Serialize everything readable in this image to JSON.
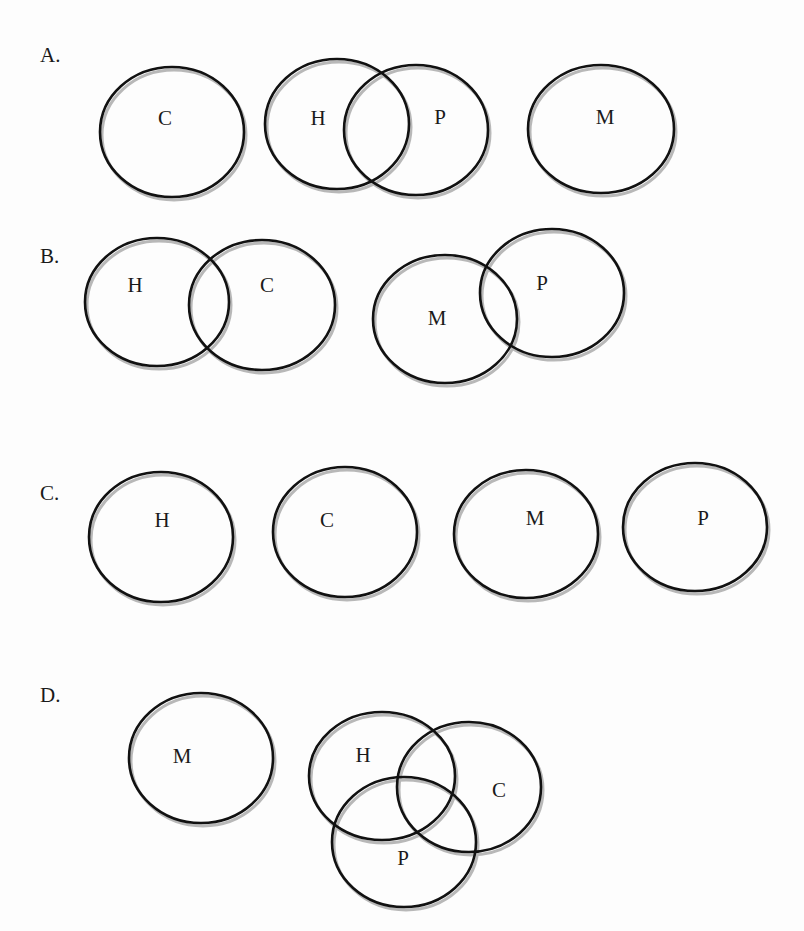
{
  "diagram": {
    "type": "set-relationship-options",
    "colors": {
      "stroke": "#111111",
      "shadow": "#b8b8b8",
      "text": "#1a1a1a",
      "background": "#fdfdfd"
    },
    "options": [
      {
        "label": "A.",
        "label_pos": [
          40,
          62
        ],
        "sets": [
          {
            "name": "C",
            "cx": 172,
            "cy": 132,
            "rx": 72,
            "ry": 65,
            "text_pos": [
              165,
              118
            ]
          },
          {
            "name": "H",
            "cx": 337,
            "cy": 124,
            "rx": 72,
            "ry": 65,
            "text_pos": [
              318,
              118
            ]
          },
          {
            "name": "P",
            "cx": 416,
            "cy": 130,
            "rx": 72,
            "ry": 65,
            "text_pos": [
              440,
              117
            ]
          },
          {
            "name": "M",
            "cx": 601,
            "cy": 129,
            "rx": 73,
            "ry": 64,
            "text_pos": [
              605,
              117
            ]
          }
        ],
        "overlaps": [
          [
            "H",
            "P"
          ]
        ]
      },
      {
        "label": "B.",
        "label_pos": [
          40,
          263
        ],
        "sets": [
          {
            "name": "H",
            "cx": 157,
            "cy": 302,
            "rx": 72,
            "ry": 64,
            "text_pos": [
              135,
              285
            ]
          },
          {
            "name": "C",
            "cx": 262,
            "cy": 305,
            "rx": 73,
            "ry": 65,
            "text_pos": [
              267,
              285
            ]
          },
          {
            "name": "M",
            "cx": 445,
            "cy": 319,
            "rx": 72,
            "ry": 64,
            "text_pos": [
              437,
              318
            ]
          },
          {
            "name": "P",
            "cx": 552,
            "cy": 293,
            "rx": 72,
            "ry": 64,
            "text_pos": [
              542,
              283
            ]
          }
        ],
        "overlaps": [
          [
            "H",
            "C"
          ],
          [
            "M",
            "P"
          ]
        ]
      },
      {
        "label": "C.",
        "label_pos": [
          40,
          500
        ],
        "sets": [
          {
            "name": "H",
            "cx": 161,
            "cy": 537,
            "rx": 72,
            "ry": 65,
            "text_pos": [
              162,
              520
            ]
          },
          {
            "name": "C",
            "cx": 345,
            "cy": 532,
            "rx": 72,
            "ry": 65,
            "text_pos": [
              327,
              520
            ]
          },
          {
            "name": "M",
            "cx": 526,
            "cy": 534,
            "rx": 72,
            "ry": 64,
            "text_pos": [
              535,
              518
            ]
          },
          {
            "name": "P",
            "cx": 695,
            "cy": 527,
            "rx": 72,
            "ry": 64,
            "text_pos": [
              703,
              518
            ]
          }
        ],
        "overlaps": []
      },
      {
        "label": "D.",
        "label_pos": [
          40,
          702
        ],
        "sets": [
          {
            "name": "M",
            "cx": 201,
            "cy": 758,
            "rx": 72,
            "ry": 65,
            "text_pos": [
              182,
              756
            ]
          },
          {
            "name": "H",
            "cx": 382,
            "cy": 776,
            "rx": 73,
            "ry": 64,
            "text_pos": [
              363,
              755
            ]
          },
          {
            "name": "C",
            "cx": 469,
            "cy": 787,
            "rx": 72,
            "ry": 65,
            "text_pos": [
              499,
              790
            ]
          },
          {
            "name": "P",
            "cx": 404,
            "cy": 842,
            "rx": 72,
            "ry": 65,
            "text_pos": [
              403,
              858
            ]
          }
        ],
        "overlaps": [
          [
            "H",
            "C"
          ],
          [
            "H",
            "P"
          ],
          [
            "C",
            "P"
          ]
        ]
      }
    ]
  }
}
